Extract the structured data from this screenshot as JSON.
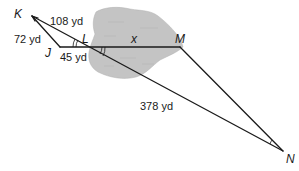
{
  "figure": {
    "colors": {
      "lake_fill": "#c4c4c4",
      "line": "#1a1a1a",
      "background": "#ffffff"
    },
    "vertices": {
      "K": "K",
      "J": "J",
      "L": "L",
      "M": "M",
      "N": "N"
    },
    "measurements": {
      "KL": "108 yd",
      "KJ": "72 yd",
      "JL": "45 yd",
      "LM": "x",
      "LN": "378 yd"
    },
    "region": "lake"
  }
}
